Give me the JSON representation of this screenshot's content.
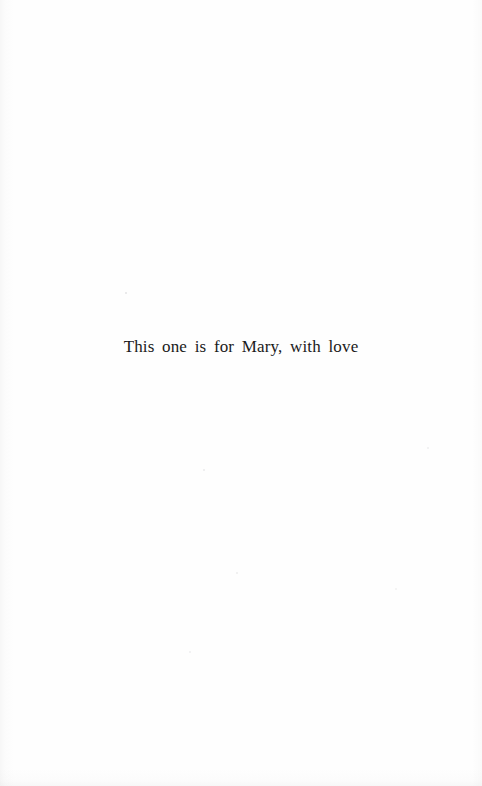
{
  "page": {
    "kind": "book-dedication-page",
    "background_color": "#fefefe",
    "ink_color": "#1a1a1a"
  },
  "dedication": {
    "text": "This one is for Mary, with love"
  }
}
